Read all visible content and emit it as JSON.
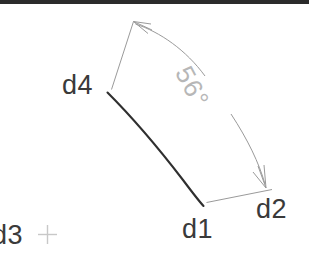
{
  "view": {
    "background_color": "#ffffff",
    "top_bar_color": "#2b2b2b",
    "width": 309,
    "height": 266
  },
  "colors": {
    "geometry_line": "#2f2f2f",
    "dimension_line": "#9a9a9a",
    "dimension_text": "#b7b7b7",
    "label_text": "#3a3a3a",
    "marker": "#c8c8c8"
  },
  "labels": {
    "d4": "d4",
    "d1": "d1",
    "d2": "d2",
    "d3": "d3"
  },
  "dimension": {
    "angle_text": "56°",
    "value": 56,
    "unit": "degrees"
  },
  "markers": {
    "origin_crosshair": "+"
  },
  "icons": {
    "crosshair": "crosshair-marker-icon",
    "arrowhead_start": "arrowhead-icon",
    "arrowhead_end": "arrowhead-icon"
  },
  "geometry": {
    "arc_start_point": "d4",
    "arc_end_point": "d1",
    "extension_start_point": "d4",
    "extension_end_point": "d2"
  }
}
